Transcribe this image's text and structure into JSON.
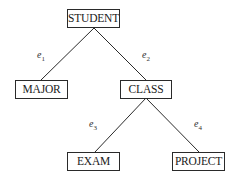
{
  "diagram": {
    "type": "tree",
    "nodes": [
      {
        "id": "student",
        "label": "STUDENT"
      },
      {
        "id": "major",
        "label": "MAJOR"
      },
      {
        "id": "class",
        "label": "CLASS"
      },
      {
        "id": "exam",
        "label": "EXAM"
      },
      {
        "id": "project",
        "label": "PROJECT"
      }
    ],
    "edges": [
      {
        "from": "student",
        "to": "major",
        "label": "e",
        "sub": "1"
      },
      {
        "from": "student",
        "to": "class",
        "label": "e",
        "sub": "2"
      },
      {
        "from": "class",
        "to": "exam",
        "label": "e",
        "sub": "3"
      },
      {
        "from": "class",
        "to": "project",
        "label": "e",
        "sub": "4"
      }
    ],
    "colors": {
      "line": "#2a2a2a",
      "background": "#ffffff"
    }
  }
}
